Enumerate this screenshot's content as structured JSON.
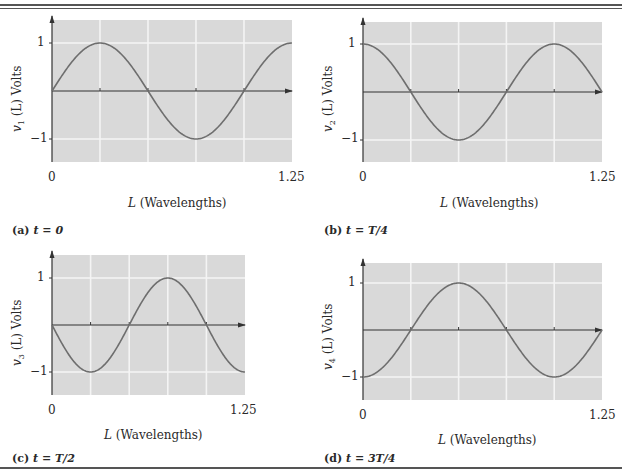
{
  "chart_data": [
    {
      "type": "line",
      "panel": "a",
      "caption": "(a) t = 0",
      "ylabel": "v1 (L) Volts",
      "xlabel": "L (Wavelengths)",
      "xlim": [
        0,
        1.25
      ],
      "ylim": [
        -1.25,
        1.25
      ],
      "x_ticks": [
        "0",
        "1.25"
      ],
      "y_ticks": [
        "1",
        "-1"
      ],
      "grid": true,
      "function": "sin(2*pi*L)",
      "x": [
        0,
        0.25,
        0.5,
        0.75,
        1.0,
        1.25
      ],
      "values": [
        0,
        1,
        0,
        -1,
        0,
        1
      ]
    },
    {
      "type": "line",
      "panel": "b",
      "caption": "(b) t = T/4",
      "ylabel": "v2 (L) Volts",
      "xlabel": "L (Wavelengths)",
      "xlim": [
        0,
        1.25
      ],
      "ylim": [
        -1.25,
        1.25
      ],
      "x_ticks": [
        "0",
        "1.25"
      ],
      "y_ticks": [
        "1",
        "-1"
      ],
      "grid": true,
      "function": "cos(2*pi*L)",
      "x": [
        0,
        0.25,
        0.5,
        0.75,
        1.0,
        1.25
      ],
      "values": [
        1,
        0,
        -1,
        0,
        1,
        0
      ]
    },
    {
      "type": "line",
      "panel": "c",
      "caption": "(c) t = T/2",
      "ylabel": "v3 (L) Volts",
      "xlabel": "L (Wavelengths)",
      "xlim": [
        0,
        1.25
      ],
      "ylim": [
        -1.25,
        1.25
      ],
      "x_ticks": [
        "0",
        "1.25"
      ],
      "y_ticks": [
        "1",
        "-1"
      ],
      "grid": true,
      "function": "-sin(2*pi*L)",
      "x": [
        0,
        0.25,
        0.5,
        0.75,
        1.0,
        1.25
      ],
      "values": [
        0,
        -1,
        0,
        1,
        0,
        -1
      ]
    },
    {
      "type": "line",
      "panel": "d",
      "caption": "(d) t = 3T/4",
      "ylabel": "v4 (L) Volts",
      "xlabel": "L (Wavelengths)",
      "xlim": [
        0,
        1.25
      ],
      "ylim": [
        -1.25,
        1.25
      ],
      "x_ticks": [
        "0",
        "1.25"
      ],
      "y_ticks": [
        "1",
        "-1"
      ],
      "grid": true,
      "function": "-cos(2*pi*L)",
      "x": [
        0,
        0.25,
        0.5,
        0.75,
        1.0,
        1.25
      ],
      "values": [
        -1,
        0,
        1,
        0,
        -1,
        0
      ]
    }
  ],
  "panels": [
    {
      "cap_letter": "(a)",
      "cap_t": "t",
      "cap_eq": " = ",
      "cap_val": "0",
      "x0": "0",
      "x1": "1.25",
      "y1": "1",
      "ym1": "−1",
      "xlabel_var": "L",
      "xlabel_unit": " (Wavelengths)",
      "ylabel_var": "v",
      "ylabel_sub": "1",
      "ylabel_rest": " (L) Volts"
    },
    {
      "cap_letter": "(b)",
      "cap_t": "t",
      "cap_eq": " = ",
      "cap_val": "T/4",
      "x0": "0",
      "x1": "1.25",
      "y1": "1",
      "ym1": "−1",
      "xlabel_var": "L",
      "xlabel_unit": " (Wavelengths)",
      "ylabel_var": "v",
      "ylabel_sub": "2",
      "ylabel_rest": " (L) Volts"
    },
    {
      "cap_letter": "(c)",
      "cap_t": "t",
      "cap_eq": " = ",
      "cap_val": "T/2",
      "x0": "0",
      "x1": "1.25",
      "y1": "1",
      "ym1": "−1",
      "xlabel_var": "L",
      "xlabel_unit": " (Wavelengths)",
      "ylabel_var": "v",
      "ylabel_sub": "3",
      "ylabel_rest": " (L) Volts"
    },
    {
      "cap_letter": "(d)",
      "cap_t": "t",
      "cap_eq": " = ",
      "cap_val": "3T/4",
      "x0": "0",
      "x1": "1.25",
      "y1": "1",
      "ym1": "−1",
      "xlabel_var": "L",
      "xlabel_unit": " (Wavelengths)",
      "ylabel_var": "v",
      "ylabel_sub": "4",
      "ylabel_rest": " (L) Volts"
    }
  ],
  "colors": {
    "plot_bg": "#d9d9d9",
    "grid": "#f4f4f4",
    "curve": "#6e6e6e",
    "axis": "#333333"
  }
}
